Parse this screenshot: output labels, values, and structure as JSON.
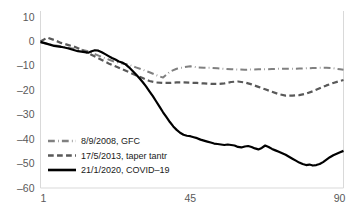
{
  "chart_data": {
    "type": "line",
    "title": "",
    "subtitle": "",
    "xlabel": "",
    "ylabel": "",
    "xlim": [
      1,
      90
    ],
    "ylim": [
      -60,
      10
    ],
    "grid": false,
    "legend_position": "inside-bottom-left",
    "x_ticks": [
      "1",
      "45",
      "90"
    ],
    "x_tick_values": [
      1,
      45,
      90
    ],
    "y_ticks": [
      "10",
      "0",
      "-10",
      "-20",
      "-30",
      "-40",
      "-50",
      "-60"
    ],
    "y_tick_values": [
      10,
      0,
      -10,
      -20,
      -30,
      -40,
      -50,
      -60
    ],
    "series": [
      {
        "name": "8/9/2008, GFC",
        "color": "#808080",
        "style": "dash-dot",
        "width": 2.0,
        "x": [
          1,
          3,
          5,
          7,
          9,
          11,
          13,
          15,
          17,
          19,
          21,
          23,
          25,
          27,
          29,
          31,
          33,
          35,
          37,
          39,
          41,
          43,
          45,
          47,
          49,
          51,
          53,
          55,
          57,
          59,
          61,
          63,
          65,
          67,
          69,
          71,
          73,
          75,
          77,
          79,
          81,
          83,
          85,
          87,
          89,
          90
        ],
        "values": [
          -0.4,
          -1.0,
          -1.6,
          -2.0,
          -2.6,
          -3.0,
          -3.4,
          -4.0,
          -5.2,
          -6.4,
          -7.4,
          -8.4,
          -9.0,
          -9.6,
          -10.6,
          -11.6,
          -12.6,
          -13.8,
          -14.8,
          -12.4,
          -11.2,
          -10.6,
          -10.2,
          -10.6,
          -10.8,
          -10.8,
          -11.0,
          -11.2,
          -11.4,
          -11.5,
          -11.6,
          -11.5,
          -11.4,
          -11.4,
          -11.3,
          -11.2,
          -11.2,
          -11.2,
          -11.1,
          -11.0,
          -10.9,
          -10.8,
          -10.8,
          -11.0,
          -11.4,
          -11.6
        ]
      },
      {
        "name": "17/5/2013, taper tantr",
        "color": "#595959",
        "style": "dashed",
        "width": 2.2,
        "x": [
          1,
          3,
          5,
          7,
          9,
          11,
          13,
          15,
          17,
          19,
          21,
          23,
          25,
          27,
          29,
          31,
          33,
          35,
          37,
          39,
          41,
          43,
          45,
          47,
          49,
          51,
          53,
          55,
          57,
          59,
          61,
          63,
          65,
          67,
          69,
          71,
          73,
          75,
          77,
          79,
          81,
          83,
          85,
          87,
          89,
          90
        ],
        "values": [
          0.0,
          1.6,
          0.6,
          -0.6,
          -1.4,
          -2.2,
          -3.4,
          -4.8,
          -6.2,
          -7.6,
          -9.0,
          -10.2,
          -11.4,
          -12.6,
          -13.8,
          -15.0,
          -16.2,
          -16.8,
          -17.0,
          -17.0,
          -16.8,
          -16.8,
          -16.9,
          -17.0,
          -17.2,
          -17.4,
          -17.4,
          -17.2,
          -16.6,
          -16.4,
          -16.8,
          -17.6,
          -18.6,
          -19.6,
          -20.6,
          -21.6,
          -22.2,
          -22.2,
          -22.0,
          -21.4,
          -20.4,
          -19.2,
          -18.0,
          -17.0,
          -16.2,
          -15.8
        ]
      },
      {
        "name": "21/1/2020, COVID–19",
        "color": "#000000",
        "style": "solid",
        "width": 2.2,
        "x": [
          1,
          2,
          3,
          4,
          5,
          6,
          7,
          8,
          9,
          10,
          11,
          12,
          13,
          14,
          15,
          16,
          17,
          18,
          19,
          20,
          21,
          22,
          23,
          24,
          25,
          26,
          27,
          28,
          29,
          30,
          31,
          32,
          33,
          34,
          35,
          36,
          37,
          38,
          39,
          40,
          41,
          42,
          43,
          44,
          45,
          46,
          47,
          48,
          49,
          50,
          51,
          52,
          53,
          54,
          55,
          56,
          57,
          58,
          59,
          60,
          61,
          62,
          63,
          64,
          65,
          66,
          67,
          68,
          69,
          70,
          71,
          72,
          73,
          74,
          75,
          76,
          77,
          78,
          79,
          80,
          81,
          82,
          83,
          84,
          85,
          86,
          87,
          88,
          89,
          90
        ],
        "values": [
          -0.2,
          -0.6,
          -1.0,
          -1.4,
          -1.8,
          -2.0,
          -2.2,
          -2.5,
          -2.8,
          -3.2,
          -3.6,
          -4.0,
          -4.2,
          -4.4,
          -4.6,
          -4.0,
          -3.6,
          -3.8,
          -4.4,
          -5.2,
          -6.0,
          -6.8,
          -7.4,
          -8.2,
          -8.6,
          -9.4,
          -10.6,
          -12.0,
          -13.4,
          -15.0,
          -16.6,
          -18.4,
          -20.4,
          -22.4,
          -24.6,
          -26.8,
          -29.0,
          -31.0,
          -33.0,
          -34.8,
          -36.2,
          -37.4,
          -38.2,
          -38.6,
          -38.8,
          -39.2,
          -39.6,
          -40.2,
          -40.6,
          -41.0,
          -41.4,
          -41.8,
          -42.0,
          -42.2,
          -42.4,
          -42.2,
          -42.4,
          -42.6,
          -43.2,
          -43.4,
          -43.0,
          -42.8,
          -43.2,
          -43.8,
          -44.2,
          -43.6,
          -42.6,
          -43.2,
          -44.0,
          -44.6,
          -45.2,
          -45.8,
          -46.4,
          -47.2,
          -48.0,
          -48.8,
          -49.6,
          -50.2,
          -50.6,
          -50.4,
          -50.8,
          -50.6,
          -50.2,
          -49.4,
          -48.4,
          -47.4,
          -46.6,
          -46.0,
          -45.4,
          -44.8
        ]
      }
    ]
  },
  "legend": {
    "items": [
      {
        "label": "8/9/2008, GFC",
        "style": "dash-dot",
        "color": "#808080"
      },
      {
        "label": "17/5/2013, taper tantr",
        "style": "dashed",
        "color": "#595959"
      },
      {
        "label": "21/1/2020, COVID–19",
        "style": "solid",
        "color": "#000000"
      }
    ]
  }
}
